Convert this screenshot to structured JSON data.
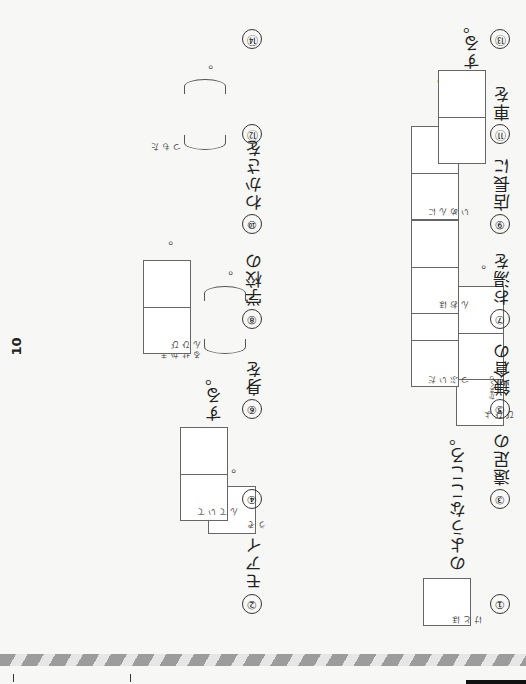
{
  "page": {
    "number": "10",
    "orientation": "rotated 180°"
  },
  "questions": [
    {
      "no": "①",
      "prefix": "",
      "boxes": 1,
      "furigana": [
        "ほ",
        "と",
        "け"
      ],
      "suffix": "のようなこころ。",
      "end": ""
    },
    {
      "no": "②",
      "prefix": "モアイ",
      "boxes": 1,
      "furigana": [
        "ぞ",
        "う"
      ],
      "suffix": "",
      "end": "。"
    },
    {
      "no": "③",
      "prefix": "遠足の",
      "boxes": 3,
      "furigana": [
        "よ",
        "て",
        "び",
        "ぴ"
      ],
      "suffix": "",
      "end": "。"
    },
    {
      "no": "④",
      "prefix": "",
      "boxes": 2,
      "furigana": [
        "て",
        "い",
        "て",
        "ん"
      ],
      "suffix": "する。",
      "end": ""
    },
    {
      "no": "⑤",
      "prefix": "鎌倉の",
      "prefix_ruby": "かまくら",
      "boxes": 2,
      "furigana": [
        "だ",
        "い",
        "ぶ",
        "つ"
      ],
      "suffix": "",
      "end": "。"
    },
    {
      "no": "⑥",
      "prefix": "身を",
      "boxes": 0,
      "paren": true,
      "furigana": [
        "ま",
        "か",
        "せ",
        "る"
      ],
      "suffix": "",
      "end": "。"
    },
    {
      "no": "⑦",
      "prefix": "お湯を",
      "boxes": 2,
      "furigana": [
        "ほ",
        "お",
        "ん"
      ],
      "suffix": "する。",
      "end": ""
    },
    {
      "no": "⑧",
      "prefix": "学校の",
      "boxes": 2,
      "furigana": [
        "び",
        "ひ",
        "ん"
      ],
      "suffix": "",
      "end": "。"
    },
    {
      "no": "⑨",
      "prefix": "店長に",
      "boxes": 2,
      "furigana": [
        "に",
        "ん",
        "め",
        "い"
      ],
      "suffix": "する。",
      "end": ""
    },
    {
      "no": "⑩",
      "prefix": "わかさを",
      "boxes": 0,
      "paren": true,
      "furigana": [
        "た",
        "も",
        "つ"
      ],
      "suffix": "",
      "end": "。"
    },
    {
      "no": "⑪",
      "prefix": "車を",
      "boxes": 2,
      "furigana": [
        "て",
        "い",
        "し"
      ],
      "suffix": "する。",
      "end": ""
    },
    {
      "no": "⑫",
      "prefix": "試験に",
      "boxes": 0,
      "paren": true,
      "furigana": [
        "そ",
        "な",
        "え",
        "る"
      ],
      "suffix": "",
      "end": "。"
    },
    {
      "no": "⑬",
      "prefix": "",
      "boxes": 2,
      "furigana": [
        "そ",
        "う",
        "ぞ",
        "う"
      ],
      "suffix": "がつく。",
      "end": ""
    },
    {
      "no": "⑭",
      "prefix": "",
      "boxes": 3,
      "furigana": [
        "ほ",
        "け",
        "ん",
        "し",
        "つ"
      ],
      "suffix": "",
      "end": "。"
    }
  ],
  "colors": {
    "paper": "#f7f7f5",
    "ink": "#222222",
    "box_border": "#666666",
    "stripe_dark": "#9c9c9c",
    "stripe_light": "#e6e6e6"
  }
}
